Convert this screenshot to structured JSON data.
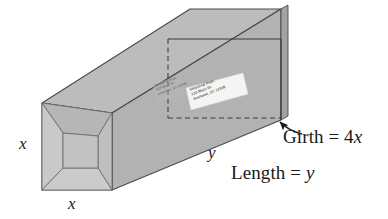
{
  "figure": {
    "type": "geometry-diagram",
    "labels": {
      "x_left": "x",
      "x_bottom": "x",
      "y_side": "y",
      "girth": "Girth = 4x",
      "girth_prefix": "Girth = 4",
      "girth_var": "x",
      "length": "Length = y",
      "length_prefix": "Length = ",
      "length_var": "y"
    },
    "shipping_label": {
      "line1": "Shipping Dept.",
      "line2": "123 Main St.",
      "line3": "Anytown, ST 12345"
    },
    "colors": {
      "top_face": "#b9b9b9",
      "side_face": "#b0b0b0",
      "front_face": "#c4c4c4",
      "front_flap_light": "#c9c9c9",
      "front_flap_dark": "#b4b4b4",
      "end_face": "#a8a8a8",
      "outline": "#4a4a4a",
      "dashed_line": "#3c3c3c",
      "label_paper": "#f2f2f0",
      "text": "#1a1a1a",
      "background": "#ffffff"
    },
    "annotations": {
      "arrow_from_girth_to_box": "callout arrow pointing from Girth label to the box corner"
    }
  }
}
